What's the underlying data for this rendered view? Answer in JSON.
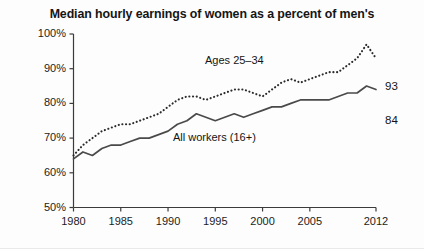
{
  "chart_data": {
    "type": "line",
    "title": "Median hourly earnings of women as a percent of men's",
    "xlabel": "",
    "ylabel": "",
    "xlim": [
      1980,
      2012
    ],
    "ylim": [
      50,
      100
    ],
    "grid": false,
    "legend_position": "inline-annotation",
    "y_ticks": [
      "50%",
      "60%",
      "70%",
      "80%",
      "90%",
      "100%"
    ],
    "y_tick_values": [
      50,
      60,
      70,
      80,
      90,
      100
    ],
    "x_ticks": [
      "1980",
      "1985",
      "1990",
      "1995",
      "2000",
      "2005",
      "2012"
    ],
    "x_tick_values": [
      1980,
      1985,
      1990,
      1995,
      2000,
      2005,
      2012
    ],
    "x": [
      1980,
      1981,
      1982,
      1983,
      1984,
      1985,
      1986,
      1987,
      1988,
      1989,
      1990,
      1991,
      1992,
      1993,
      1994,
      1995,
      1996,
      1997,
      1998,
      1999,
      2000,
      2001,
      2002,
      2003,
      2004,
      2005,
      2006,
      2007,
      2008,
      2009,
      2010,
      2011,
      2012
    ],
    "series": [
      {
        "name": "Ages 25-34",
        "label": "Ages 25–34",
        "style": "dotted",
        "color": "#2b2b2b",
        "end_value": 93,
        "end_label": "93",
        "values": [
          65,
          68,
          70,
          72,
          73,
          74,
          74,
          75,
          76,
          77,
          79,
          81,
          82,
          82,
          81,
          82,
          83,
          84,
          84,
          83,
          82,
          84,
          86,
          87,
          86,
          87,
          88,
          89,
          89,
          91,
          93,
          97,
          93
        ]
      },
      {
        "name": "All workers (16+)",
        "label": "All workers (16+)",
        "style": "solid",
        "color": "#4a4a4a",
        "end_value": 84,
        "end_label": "84",
        "values": [
          64,
          66,
          65,
          67,
          68,
          68,
          69,
          70,
          70,
          71,
          72,
          74,
          75,
          77,
          76,
          75,
          76,
          77,
          76,
          77,
          78,
          79,
          79,
          80,
          81,
          81,
          81,
          81,
          82,
          83,
          83,
          85,
          84
        ]
      }
    ]
  }
}
